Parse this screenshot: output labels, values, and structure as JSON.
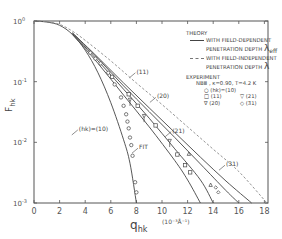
{
  "chart_data": {
    "type": "line",
    "title": "",
    "xlabel": "q_hk",
    "xlabel_main": "q",
    "xlabel_sub": "hk",
    "xunit": "(10⁻³Å⁻¹)",
    "ylabel": "F_hk",
    "ylabel_main": "F",
    "ylabel_sub": "hk",
    "xlim": [
      0,
      18.5
    ],
    "ylim": [
      0.001,
      1
    ],
    "yscale": "log",
    "xticks": [
      "0",
      "2",
      "4",
      "6",
      "8",
      "10",
      "12",
      "14",
      "16",
      "18"
    ],
    "yticks": [
      {
        "base": "10",
        "exp": "0",
        "value": 1
      },
      {
        "base": "10",
        "exp": "-1",
        "value": 0.1
      },
      {
        "base": "10",
        "exp": "-2",
        "value": 0.01
      },
      {
        "base": "10",
        "exp": "-3",
        "value": 0.001
      }
    ],
    "grid": false,
    "legend_position": "upper right",
    "legend": {
      "theory_title": "THEORY",
      "solid_label_1": "WITH FIELD-DEPENDENT",
      "solid_label_2": "PENETRATION DEPTH",
      "solid_symbol": "λ",
      "solid_symbol_sub": "eff",
      "dashed_label_1": "WITH FIELD-INDEPENDENT",
      "dashed_label_2": "PENETRATION DEPTH",
      "dashed_symbol": "λ",
      "experiment_title": "EXPERIMENT",
      "sample": "NBⅢ , κ=0.90, T=4.2 K",
      "markers": [
        {
          "symbol": "○",
          "label": "(hk)=(10)"
        },
        {
          "symbol": "□",
          "label": "(11)"
        },
        {
          "symbol": "▽",
          "label": "(21)"
        },
        {
          "symbol": "∇",
          "label": "(20)"
        },
        {
          "symbol": "◇",
          "label": "(31)"
        }
      ]
    },
    "series": [
      {
        "name": "(10) theory",
        "style": "solid",
        "x": [
          0,
          1,
          2,
          3,
          4,
          5,
          6,
          7,
          7.5,
          8.0
        ],
        "y": [
          1,
          0.96,
          0.85,
          0.6,
          0.33,
          0.14,
          0.045,
          0.011,
          0.0045,
          0.001
        ]
      },
      {
        "name": "(11) theory",
        "style": "solid",
        "x": [
          3,
          5,
          7,
          9,
          11,
          12,
          13
        ],
        "y": [
          0.6,
          0.2,
          0.06,
          0.018,
          0.005,
          0.0024,
          0.001
        ]
      },
      {
        "name": "(20) theory",
        "style": "solid",
        "x": [
          3,
          5,
          7,
          9,
          11,
          13,
          14
        ],
        "y": [
          0.62,
          0.22,
          0.075,
          0.025,
          0.0078,
          0.0024,
          0.001
        ]
      },
      {
        "name": "(21) theory",
        "style": "solid",
        "x": [
          3,
          5,
          7,
          9,
          11,
          13,
          15,
          16
        ],
        "y": [
          0.63,
          0.24,
          0.085,
          0.032,
          0.012,
          0.0044,
          0.0016,
          0.001
        ]
      },
      {
        "name": "(31) theory",
        "style": "solid",
        "x": [
          3,
          5,
          7,
          9,
          11,
          13,
          15,
          17
        ],
        "y": [
          0.64,
          0.25,
          0.095,
          0.037,
          0.0145,
          0.0057,
          0.0023,
          0.001
        ]
      },
      {
        "name": "field-independent",
        "style": "dashed",
        "x": [
          0,
          1,
          2,
          3,
          4,
          6,
          8,
          10,
          12,
          14,
          16,
          18.2
        ],
        "y": [
          1,
          0.97,
          0.88,
          0.68,
          0.48,
          0.22,
          0.095,
          0.042,
          0.018,
          0.0077,
          0.0033,
          0.001
        ]
      },
      {
        "name": "(hk)=(10) data",
        "style": "marker",
        "marker": "circle",
        "x": [
          4.4,
          4.8,
          5.2,
          5.8,
          6.3,
          6.8,
          7.0,
          7.2,
          7.3,
          7.4,
          7.5,
          7.6,
          7.7,
          7.9,
          8.0
        ],
        "y": [
          0.3,
          0.24,
          0.2,
          0.14,
          0.09,
          0.055,
          0.04,
          0.029,
          0.022,
          0.017,
          0.012,
          0.009,
          0.006,
          0.0022,
          0.0015
        ]
      },
      {
        "name": "(11) data",
        "style": "marker",
        "marker": "square",
        "x": [
          6.1,
          7.4,
          8.1,
          9.5,
          11.2,
          11.8,
          12.2
        ],
        "y": [
          0.12,
          0.062,
          0.04,
          0.019,
          0.0063,
          0.0042,
          0.0032
        ]
      },
      {
        "name": "(20) data",
        "style": "marker",
        "marker": "triangle-down",
        "x": [
          7.5,
          8.6,
          10.6
        ],
        "y": [
          0.05,
          0.027,
          0.0105
        ]
      },
      {
        "name": "(21) data",
        "style": "marker",
        "marker": "triangle-up",
        "x": [
          12.1,
          13.8
        ],
        "y": [
          0.0065,
          0.002
        ]
      },
      {
        "name": "(31) data",
        "style": "marker",
        "marker": "diamond",
        "x": [
          14.2,
          14.4
        ],
        "y": [
          0.0018,
          0.0015
        ]
      }
    ],
    "annotations": [
      {
        "text": "(11)",
        "x": 8.0,
        "y": 0.14
      },
      {
        "text": "(20)",
        "x": 9.6,
        "y": 0.055
      },
      {
        "text": "(hk)=(10)",
        "x": 3.5,
        "y": 0.016
      },
      {
        "text": "(21)",
        "x": 10.8,
        "y": 0.015
      },
      {
        "text": "FIT",
        "x": 8.2,
        "y": 0.008
      },
      {
        "text": "(31)",
        "x": 15.0,
        "y": 0.0042
      }
    ]
  }
}
